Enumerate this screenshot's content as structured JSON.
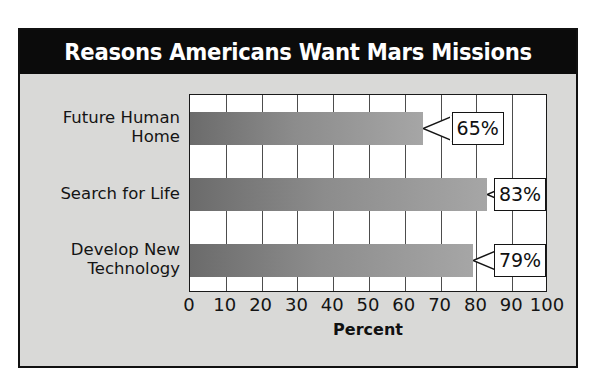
{
  "chart_data": {
    "type": "bar",
    "orientation": "horizontal",
    "title": "Reasons Americans Want Mars Missions",
    "subtitle": "",
    "xlabel": "Percent",
    "ylabel": "",
    "categories": [
      "Future Human Home",
      "Search for Life",
      "Develop New Technology"
    ],
    "category_lines": [
      [
        "Future Human",
        "Home"
      ],
      [
        "Search for Life"
      ],
      [
        "Develop New",
        "Technology"
      ]
    ],
    "values": [
      65,
      83,
      79
    ],
    "data_labels": [
      "65%",
      "83%",
      "79%"
    ],
    "xlim": [
      0,
      100
    ],
    "xticks": [
      0,
      10,
      20,
      30,
      40,
      50,
      60,
      70,
      80,
      90,
      100
    ],
    "xtick_labels": [
      "0",
      "10",
      "20",
      "30",
      "40",
      "50",
      "60",
      "70",
      "80",
      "90",
      "100"
    ],
    "grid": "vertical",
    "legend": "none",
    "bar_gradient_start": "#6b6b6b",
    "bar_gradient_end": "#a6a6a6",
    "panel_background": "#d9d9d7",
    "plot_background": "#ffffff",
    "title_background": "#0b0b0b",
    "title_color": "#ffffff",
    "gridline_color": "#4d4d4d",
    "border_color": "#111111"
  }
}
